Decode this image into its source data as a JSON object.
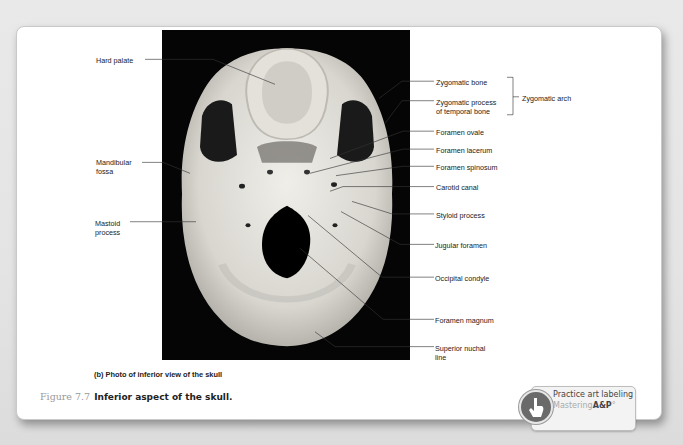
{
  "figure": {
    "panel_caption": "(b) Photo of inferior view of the skull",
    "figure_number": "Figure 7.7",
    "figure_title": "Inferior aspect of the skull."
  },
  "labels_left": [
    {
      "text": "Hard palate"
    },
    {
      "text": "Mandibular\nfossa"
    },
    {
      "text": "Mastoid\nprocess"
    }
  ],
  "labels_right": [
    {
      "text": "Zygomatic bone"
    },
    {
      "text": "Zygomatic process\nof temporal bone"
    },
    {
      "text": "Foramen ovale"
    },
    {
      "text": "Foramen lacerum"
    },
    {
      "text": "Foramen spinosum"
    },
    {
      "text": "Carotid canal"
    },
    {
      "text": "Styloid process"
    },
    {
      "text": "Jugular foramen"
    },
    {
      "text": "Occipital condyle"
    },
    {
      "text": "Foramen magnum"
    },
    {
      "text": "Superior nuchal\nline"
    }
  ],
  "bracket_label": "Zygomatic arch",
  "practice": {
    "line1": "Practice art labeling",
    "line2_prefix": "Mastering",
    "line2_brand": "A&P",
    "line2_suffix": "°"
  },
  "bottom_text": "MENU"
}
